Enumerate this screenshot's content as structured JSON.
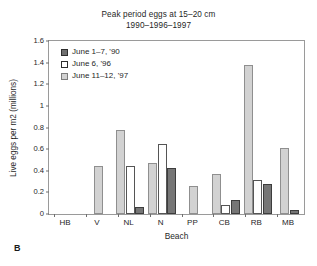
{
  "panel_label": "B",
  "chart_data": {
    "type": "bar",
    "title": "Peak period eggs at 15–20 cm",
    "subtitle": "1990–1996–1997",
    "xlabel": "Beach",
    "ylabel": "Live eggs per m2 (millions)",
    "ylim": [
      0,
      1.6
    ],
    "ytick_step": 0.2,
    "ytick_labels": [
      "0",
      "0.2",
      "0.4",
      "0.6",
      "0.8",
      "1",
      "1.2",
      "1.4",
      "1.6"
    ],
    "ytick_values": [
      0,
      0.2,
      0.4,
      0.6,
      0.8,
      1,
      1.2,
      1.4,
      1.6
    ],
    "grid": false,
    "legend_position": "top-left-inside",
    "categories": [
      "HB",
      "V",
      "NL",
      "N",
      "PP",
      "CB",
      "RB",
      "MB"
    ],
    "series": [
      {
        "name": "June 11–12, '97",
        "color": "#d2d2d2",
        "values": [
          0,
          0.44,
          0.78,
          0.47,
          0.26,
          0.37,
          1.38,
          0.61
        ]
      },
      {
        "name": "June 6, '96",
        "color": "#ffffff",
        "values": [
          0,
          0,
          0.44,
          0.65,
          0,
          0.08,
          0.31,
          0
        ]
      },
      {
        "name": "June 1–7, '90",
        "color": "#767676",
        "values": [
          0,
          0,
          0.065,
          0.43,
          0,
          0.13,
          0.28,
          0.04
        ]
      }
    ]
  },
  "legend": {
    "items": [
      {
        "label": "June 1–7, '90",
        "swatch": "s90"
      },
      {
        "label": "June 6, '96",
        "swatch": "s96"
      },
      {
        "label": "June 11–12, '97",
        "swatch": "s97"
      }
    ]
  }
}
